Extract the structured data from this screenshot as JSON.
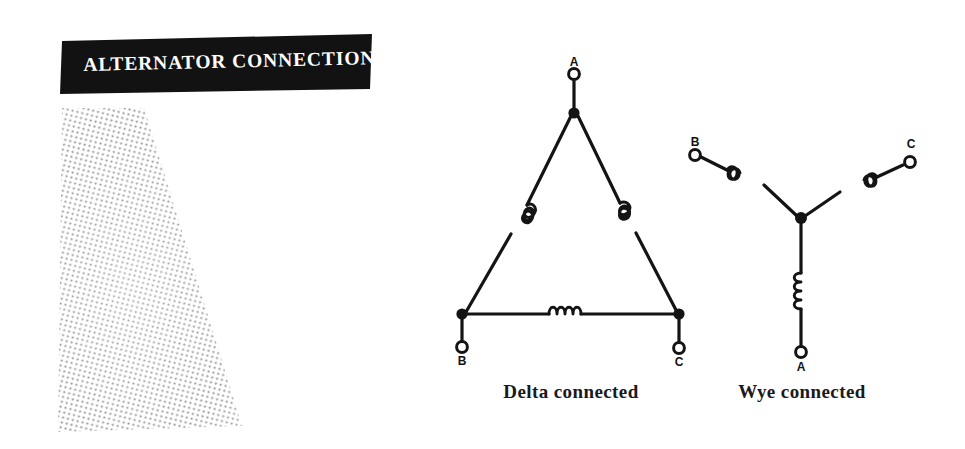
{
  "page": {
    "width": 965,
    "height": 449,
    "background_color": "#ffffff",
    "ink_color": "#111111"
  },
  "banner": {
    "title": "ALTERNATOR CONNECTIONS",
    "background_color": "#111111",
    "text_color": "#ffffff",
    "shape": "slanted-parallelogram"
  },
  "stipple": {
    "name": "halftone-stipple-block",
    "description": "dotted halftone quadrilateral",
    "dot_color": "#7a7a7a"
  },
  "diagrams": [
    {
      "id": "delta",
      "caption": "Delta connected",
      "type": "delta",
      "terminals": [
        {
          "label": "A",
          "position": "top"
        },
        {
          "label": "B",
          "position": "bottom-left"
        },
        {
          "label": "C",
          "position": "bottom-right"
        }
      ],
      "windings": 3,
      "junction_dots": 3
    },
    {
      "id": "wye",
      "caption": "Wye connected",
      "type": "wye",
      "terminals": [
        {
          "label": "B",
          "position": "top-left"
        },
        {
          "label": "C",
          "position": "top-right"
        },
        {
          "label": "A",
          "position": "bottom"
        }
      ],
      "windings": 3,
      "junction_dots": 1
    }
  ]
}
